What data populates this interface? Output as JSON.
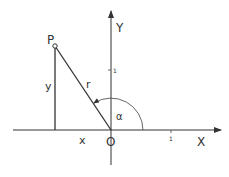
{
  "diagram": {
    "title": "",
    "point_label": "P",
    "origin_label": "O",
    "x_axis_label": "X",
    "y_axis_label": "Y",
    "radius_label": "r",
    "x_component_label": "x",
    "y_component_label": "y",
    "angle_label": "α",
    "x_tick_label": "1",
    "y_tick_label": "1",
    "colors": {
      "line": "#333333",
      "arc": "#555555",
      "background": "#ffffff"
    }
  }
}
